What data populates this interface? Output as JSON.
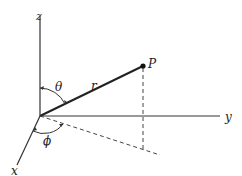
{
  "diagram": {
    "colors": {
      "ink": "#222222",
      "axis_y": "#777777",
      "background": "#ffffff"
    },
    "axes": [
      {
        "name": "z",
        "label": "z",
        "from": [
          40,
          116
        ],
        "to": [
          40,
          14
        ],
        "label_pos": [
          37,
          11
        ]
      },
      {
        "name": "y",
        "label": "y",
        "from": [
          40,
          116
        ],
        "to": [
          220,
          116
        ],
        "label_pos": [
          226,
          120
        ]
      },
      {
        "name": "x",
        "label": "x",
        "from": [
          40,
          116
        ],
        "to": [
          18,
          165
        ],
        "label_pos": [
          12,
          175
        ]
      }
    ],
    "point": {
      "label": "P",
      "pos": [
        143,
        66
      ],
      "label_pos": [
        149,
        66
      ]
    },
    "radius": {
      "label": "r",
      "from": [
        40,
        116
      ],
      "to": [
        143,
        66
      ],
      "label_pos": [
        93,
        85
      ]
    },
    "projection": {
      "vertical_drop": {
        "from": [
          143,
          66
        ],
        "to": [
          143,
          149
        ]
      },
      "ground_line": {
        "from": [
          40,
          116
        ],
        "to": [
          160,
          155
        ]
      }
    },
    "angles": [
      {
        "name": "theta",
        "label": "θ",
        "label_pos": [
          56,
          82
        ]
      },
      {
        "name": "phi",
        "label": "ϕ",
        "label_pos": [
          44,
          143
        ]
      }
    ]
  }
}
